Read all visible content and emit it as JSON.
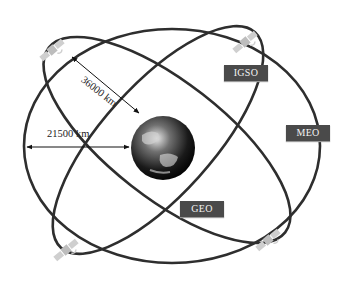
{
  "diagram": {
    "orbits": [
      {
        "name": "MEO",
        "label": "MEO"
      },
      {
        "name": "IGSO",
        "label": "IGSO"
      },
      {
        "name": "GEO",
        "label": "GEO"
      }
    ],
    "distances": {
      "inclined": "36000 km",
      "horizontal": "21500 km"
    },
    "center_body": "Earth",
    "satellite_count": 4,
    "colors": {
      "orbit": "#2e2e2e",
      "label_bg": "#4a4a4a",
      "label_text": "#f2f2f2",
      "satellite": "#c8c8c8"
    }
  }
}
